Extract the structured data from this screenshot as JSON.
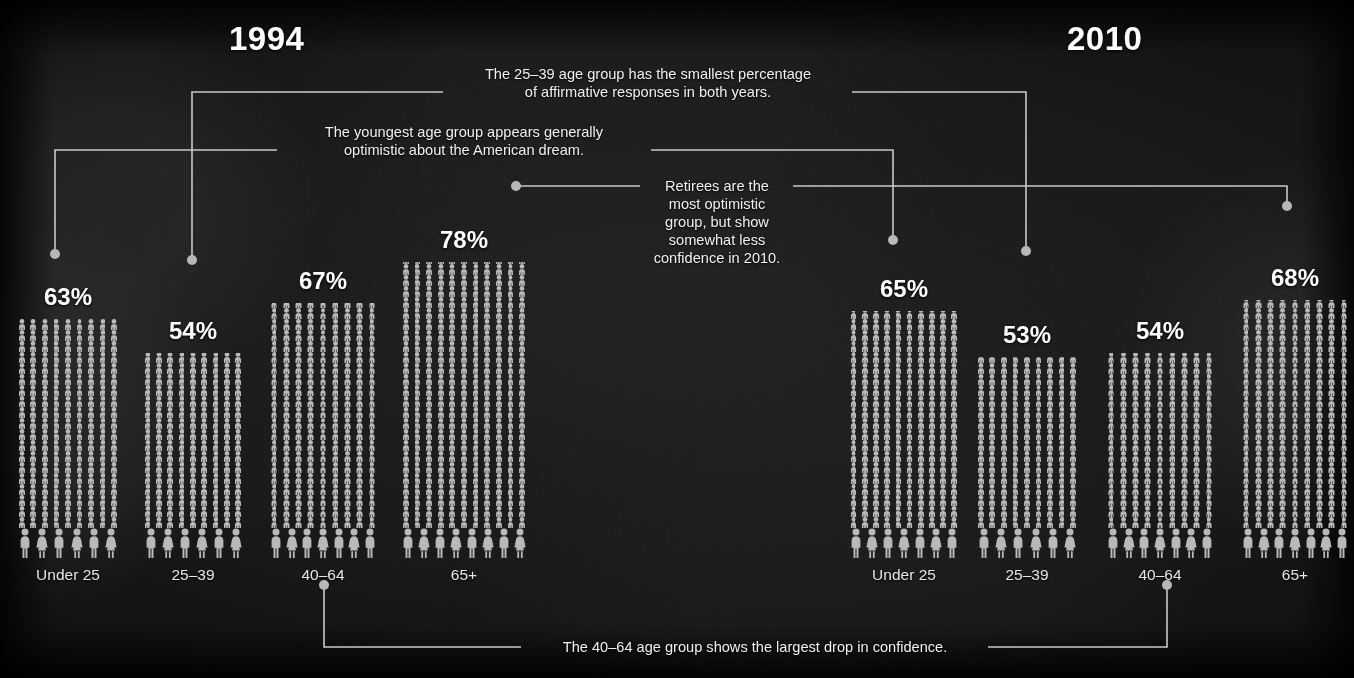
{
  "chart_data": {
    "type": "bar",
    "xlabel": "Age group",
    "ylabel": "Percent affirmative responses",
    "unit": "%",
    "ylim": [
      0,
      100
    ],
    "grid": false,
    "legend": "none",
    "categories": [
      "Under 25",
      "25–39",
      "40–64",
      "65+"
    ],
    "series": [
      {
        "name": "1994",
        "values": [
          63,
          54,
          67,
          78
        ]
      },
      {
        "name": "2010",
        "values": [
          65,
          53,
          54,
          68
        ]
      }
    ],
    "annotations": [
      "The 25–39 age group has the smallest percentage of affirmative responses in both years.",
      "The youngest age group appears generally optimistic about the American dream.",
      "Retirees are the most optimistic group, but show somewhat less confidence in 2010.",
      "The 40–64 age group shows the largest drop in confidence."
    ]
  },
  "panels": [
    {
      "year": "1994",
      "bars": [
        {
          "label": "Under 25",
          "value": "63%"
        },
        {
          "label": "25–39",
          "value": "54%"
        },
        {
          "label": "40–64",
          "value": "67%"
        },
        {
          "label": "65+",
          "value": "78%"
        }
      ]
    },
    {
      "year": "2010",
      "bars": [
        {
          "label": "Under 25",
          "value": "65%"
        },
        {
          "label": "25–39",
          "value": "53%"
        },
        {
          "label": "40–64",
          "value": "54%"
        },
        {
          "label": "65+",
          "value": "68%"
        }
      ]
    }
  ],
  "annotations": {
    "a1_line1": "The 25–39 age group has the smallest percentage",
    "a1_line2": "of affirmative responses in both years.",
    "a2_line1": "The youngest age group appears generally",
    "a2_line2": "optimistic about the American dream.",
    "a3_line1": "Retirees are the",
    "a3_line2": "most optimistic",
    "a3_line3": "group, but show",
    "a3_line4": "somewhat less",
    "a3_line5": "confidence in 2010.",
    "a4": "The 40–64 age group shows the largest drop in confidence."
  },
  "colors": {
    "background": "#121212",
    "pictogram": "#b9b9b9",
    "text": "#f2f2f2",
    "leader": "#c9c9c9"
  },
  "icons": {
    "person": "person-icon",
    "person_female": "person-female-icon"
  }
}
